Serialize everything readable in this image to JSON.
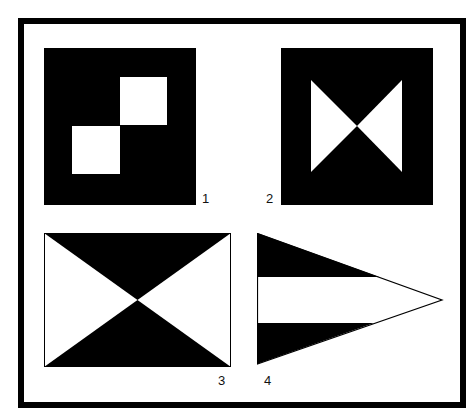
{
  "figure": {
    "frame_color": "#000000",
    "background": "#ffffff",
    "flags": [
      {
        "id": 1,
        "label": "1",
        "description": "Square black flag with two white squares arranged diagonally (top-right and bottom-left of center)",
        "fill": "#000000",
        "accent": "#ffffff"
      },
      {
        "id": 2,
        "label": "2",
        "description": "Square black flag with white bow-tie (two triangles meeting at center)",
        "fill": "#000000",
        "accent": "#ffffff"
      },
      {
        "id": 3,
        "label": "3",
        "description": "Rectangular flag divided by diagonals: black top and bottom triangles, white left and right triangles",
        "fill": "#000000",
        "accent": "#ffffff"
      },
      {
        "id": 4,
        "label": "4",
        "description": "Triangular pennant with black top stripe, white middle stripe, black bottom stripe",
        "fill": "#000000",
        "accent": "#ffffff"
      }
    ]
  }
}
